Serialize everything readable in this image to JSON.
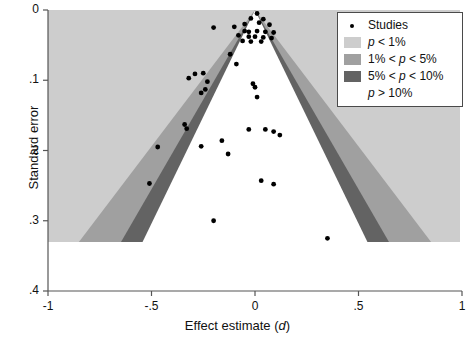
{
  "chart_data": {
    "type": "scatter",
    "title": "",
    "subtitle": "",
    "xlabel": "Effect estimate (d)",
    "ylabel": "Standard error",
    "xlabel_parts": {
      "text": "Effect estimate (",
      "italic": "d",
      "tail": ")"
    },
    "xlim": [
      -1,
      1
    ],
    "ylim": [
      0,
      0.4
    ],
    "y_inverted": true,
    "grid": false,
    "legend_position": "top-right",
    "xticks": [
      -1,
      -0.5,
      0,
      0.5,
      1
    ],
    "xtick_labels": [
      "-1",
      "-.5",
      "0",
      ".5",
      "1"
    ],
    "yticks": [
      0,
      0.1,
      0.2,
      0.3,
      0.4
    ],
    "ytick_labels": [
      "0",
      ".1",
      ".2",
      ".3",
      ".4"
    ],
    "funnel": {
      "center_effect": 0.0,
      "apex_se": 0.0,
      "shading_max_se": 0.332,
      "contour_slopes_z": {
        "p10": 1.645,
        "p05": 1.96,
        "p01": 2.576
      },
      "colors": {
        "p_gt_10": "#ffffff",
        "p_05_to_10": "#636363",
        "p_01_to_05": "#a0a0a0",
        "p_lt_01": "#cdcdcd"
      }
    },
    "series": [
      {
        "name": "Studies",
        "marker": "dot",
        "color": "#000000",
        "points": [
          [
            0.01,
            0.005
          ],
          [
            -0.02,
            0.012
          ],
          [
            0.04,
            0.013
          ],
          [
            0.02,
            0.018
          ],
          [
            -0.05,
            0.02
          ],
          [
            0.07,
            0.021
          ],
          [
            -0.1,
            0.024
          ],
          [
            -0.2,
            0.025
          ],
          [
            -0.05,
            0.03
          ],
          [
            -0.03,
            0.031
          ],
          [
            0.01,
            0.03
          ],
          [
            0.05,
            0.031
          ],
          [
            0.09,
            0.032
          ],
          [
            -0.08,
            0.036
          ],
          [
            -0.03,
            0.038
          ],
          [
            0.0,
            0.038
          ],
          [
            0.04,
            0.039
          ],
          [
            0.08,
            0.04
          ],
          [
            -0.06,
            0.044
          ],
          [
            -0.02,
            0.045
          ],
          [
            0.03,
            0.045
          ],
          [
            -0.12,
            0.063
          ],
          [
            -0.09,
            0.077
          ],
          [
            -0.25,
            0.09
          ],
          [
            -0.29,
            0.091
          ],
          [
            -0.32,
            0.097
          ],
          [
            -0.23,
            0.102
          ],
          [
            -0.01,
            0.105
          ],
          [
            0.0,
            0.11
          ],
          [
            -0.24,
            0.113
          ],
          [
            -0.26,
            0.118
          ],
          [
            0.01,
            0.124
          ],
          [
            -0.34,
            0.163
          ],
          [
            -0.33,
            0.169
          ],
          [
            -0.03,
            0.17
          ],
          [
            0.05,
            0.17
          ],
          [
            0.09,
            0.173
          ],
          [
            0.12,
            0.178
          ],
          [
            -0.16,
            0.186
          ],
          [
            -0.26,
            0.194
          ],
          [
            -0.47,
            0.195
          ],
          [
            -0.13,
            0.205
          ],
          [
            -0.51,
            0.247
          ],
          [
            0.03,
            0.243
          ],
          [
            0.09,
            0.248
          ],
          [
            -0.2,
            0.3
          ],
          [
            0.35,
            0.325
          ]
        ]
      }
    ],
    "legend": {
      "entries": [
        {
          "key": "marker",
          "label": "Studies",
          "swatch": null
        },
        {
          "key": "swatch",
          "label": "p < 1%",
          "swatch": "#cdcdcd",
          "label_parts": {
            "lead": "",
            "italic": "p",
            "tail": " < 1%"
          }
        },
        {
          "key": "swatch",
          "label": "1% < p < 5%",
          "swatch": "#a0a0a0",
          "label_parts": {
            "lead": "1% < ",
            "italic": "p",
            "tail": " < 5%"
          }
        },
        {
          "key": "swatch",
          "label": "5% < p < 10%",
          "swatch": "#636363",
          "label_parts": {
            "lead": "5% < ",
            "italic": "p",
            "tail": " < 10%"
          }
        },
        {
          "key": "blank",
          "label": "p > 10%",
          "swatch": "#ffffff",
          "label_parts": {
            "lead": "",
            "italic": "p",
            "tail": " > 10%"
          }
        }
      ]
    }
  }
}
